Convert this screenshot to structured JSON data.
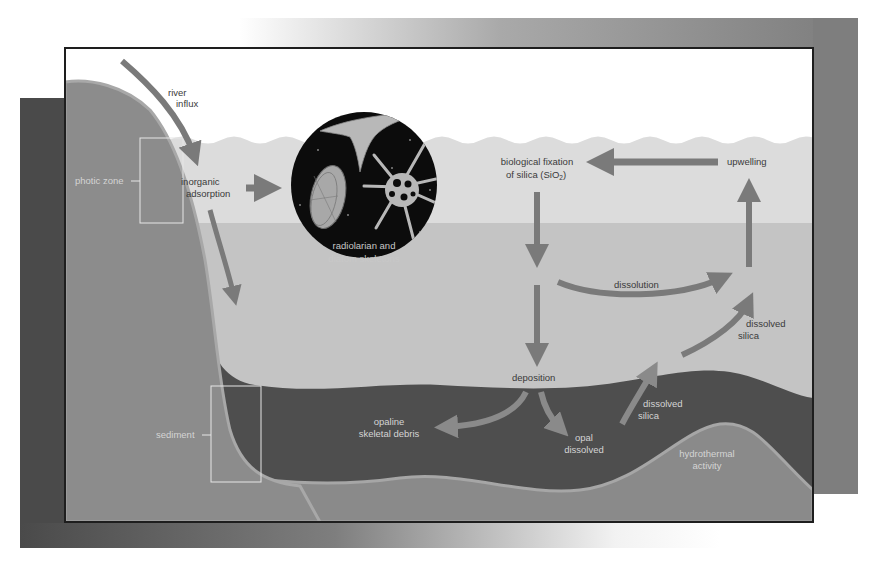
{
  "diagram": {
    "colors": {
      "background": "#ffffff",
      "left_panel": "#4a4a4a",
      "right_panel": "#7e7e7e",
      "frame_border": "#1e1e1e",
      "sky": "#ffffff",
      "photic_water": "#dcdcdc",
      "deep_water": "#c4c4c4",
      "landmass": "#8c8c8c",
      "landmass_edge": "#a8a8a8",
      "sediment": "#4e4e4e",
      "crust": "#8a8a8a",
      "crust_edge": "#a6a6a6",
      "arrow": "#7a7a7a",
      "arrow_light": "#8c8c8c",
      "inset_circle": "#0c0c0c",
      "skeleton": "#b8b8b8",
      "bracket": "#e6e6e6"
    },
    "zones": {
      "photic_zone": "photic zone",
      "sediment": "sediment"
    },
    "labels": {
      "river_influx": [
        "river",
        "influx"
      ],
      "inorganic_adsorption": [
        "inorganic",
        "adsorption"
      ],
      "inset_caption": [
        "radiolarian and",
        "diatom skeletons"
      ],
      "biological_fixation": [
        "biological fixation",
        "of silica (SiO",
        "2",
        ")"
      ],
      "upwelling": "upwelling",
      "dissolution": "dissolution",
      "dissolved_silica_upper": [
        "dissolved",
        "silica"
      ],
      "deposition": "deposition",
      "opaline_debris": [
        "opaline",
        "skeletal debris"
      ],
      "opal_dissolved": [
        "opal",
        "dissolved"
      ],
      "dissolved_silica_lower": [
        "dissolved",
        "silica"
      ],
      "hydrothermal": [
        "hydrothermal",
        "activity"
      ]
    },
    "flows": [
      {
        "from": "river influx",
        "to": "inorganic adsorption"
      },
      {
        "from": "inorganic adsorption",
        "to": "radiolarian and diatom skeletons"
      },
      {
        "from": "inorganic adsorption",
        "to": "deep water / sediment"
      },
      {
        "from": "upwelling",
        "to": "biological fixation of silica (SiO2)"
      },
      {
        "from": "biological fixation of silica (SiO2)",
        "to": "deposition"
      },
      {
        "from": "deep water",
        "to": "upwelling",
        "label": "dissolution"
      },
      {
        "from": "deposition",
        "to": "opaline skeletal debris"
      },
      {
        "from": "deposition",
        "to": "opal dissolved"
      },
      {
        "from": "sediment",
        "to": "upwelling",
        "label": "dissolved silica"
      }
    ]
  }
}
